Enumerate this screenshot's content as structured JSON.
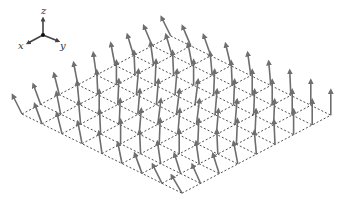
{
  "figure": {
    "axes_triad": {
      "labels": {
        "x": "x",
        "y": "y",
        "z": "z"
      },
      "origin": [
        43,
        35
      ],
      "z_tip": [
        43,
        19
      ],
      "x_tip": [
        28,
        43
      ],
      "y_tip": [
        58,
        41
      ]
    },
    "lattice": {
      "rows": 9,
      "cols": 9,
      "origin": [
        22,
        114
      ],
      "step_i": [
        20.0,
        9.9
      ],
      "step_j": [
        18.6,
        -9.75
      ],
      "line_color": "#222222",
      "dash": "2,2"
    },
    "arrow_color": "#6e6e6e",
    "arrow_length": 24,
    "arrow_tilt_dx": [
      [
        -9,
        -7,
        -5,
        -4,
        -3,
        -4,
        -6,
        -8,
        -9
      ],
      [
        -7,
        -4,
        -2,
        -1,
        0,
        -1,
        -3,
        -6,
        -8
      ],
      [
        -5,
        -2,
        0,
        1,
        2,
        1,
        -1,
        -4,
        -7
      ],
      [
        -4,
        -1,
        1,
        2,
        2,
        2,
        0,
        -2,
        -5
      ],
      [
        -3,
        0,
        2,
        3,
        3,
        3,
        1,
        -1,
        -3
      ],
      [
        -4,
        -1,
        1,
        2,
        3,
        2,
        1,
        0,
        -2
      ],
      [
        -7,
        -3,
        0,
        1,
        2,
        2,
        1,
        0,
        -1
      ],
      [
        -9,
        -6,
        -3,
        -1,
        1,
        1,
        1,
        0,
        0
      ],
      [
        -10,
        -8,
        -6,
        -4,
        -2,
        -1,
        0,
        0,
        0
      ]
    ],
    "arrow_tilt_dy_extra": [
      [
        6,
        5,
        4,
        3,
        3,
        3,
        4,
        5,
        6
      ],
      [
        5,
        3,
        2,
        1,
        1,
        1,
        2,
        4,
        5
      ],
      [
        4,
        2,
        1,
        0,
        0,
        0,
        1,
        3,
        4
      ],
      [
        3,
        1,
        0,
        0,
        0,
        0,
        0,
        2,
        3
      ],
      [
        3,
        1,
        0,
        0,
        0,
        0,
        0,
        1,
        2
      ],
      [
        4,
        2,
        0,
        0,
        0,
        0,
        0,
        0,
        1
      ],
      [
        5,
        3,
        1,
        0,
        0,
        0,
        0,
        0,
        0
      ],
      [
        6,
        5,
        3,
        1,
        0,
        0,
        0,
        0,
        0
      ],
      [
        7,
        6,
        5,
        3,
        2,
        1,
        0,
        0,
        0
      ]
    ]
  }
}
